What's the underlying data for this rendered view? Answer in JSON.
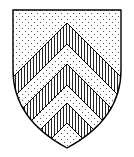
{
  "blazon": "Or, three chevronels Gules",
  "tinctures": {
    "field": {
      "name": "Or",
      "hatching": "dotted",
      "color": "#000000"
    },
    "charge": {
      "name": "Gules",
      "hatching": "vertical-lines",
      "color": "#000000"
    }
  },
  "charges": [
    {
      "name": "chevronel-1",
      "outer_apex_y": 23,
      "inner_apex_y": 44
    },
    {
      "name": "chevronel-2",
      "outer_apex_y": 64,
      "inner_apex_y": 85
    },
    {
      "name": "chevronel-3",
      "outer_apex_y": 103,
      "inner_apex_y": 123
    }
  ],
  "colors": {
    "outline": "#000000",
    "background": "#ffffff"
  }
}
